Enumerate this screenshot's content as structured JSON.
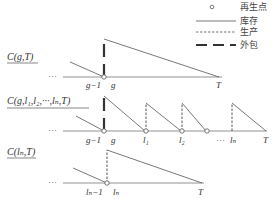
{
  "legend": {
    "items": [
      {
        "symbol": "circle",
        "label": "再生点"
      },
      {
        "symbol": "solid-line",
        "label": "库存"
      },
      {
        "symbol": "dashed-line",
        "label": "生产"
      },
      {
        "symbol": "thick-dashed-line",
        "label": "外包"
      }
    ]
  },
  "panels": [
    {
      "title": "C(g,T)",
      "ellipsis": "···",
      "ticks": [
        "g−1",
        "g",
        "T"
      ]
    },
    {
      "title": "C(g,l₁,l₂,···,lₙ,T)",
      "ellipsis": "···",
      "ticks": [
        "g−1",
        "g",
        "l₁",
        "l₂",
        "···",
        "lₙ",
        "T"
      ]
    },
    {
      "title": "C(lₙ,T)",
      "ellipsis": "···",
      "ticks": [
        "lₙ−1",
        "lₙ",
        "T"
      ]
    }
  ],
  "colors": {
    "line": "#555555",
    "text": "#333333",
    "background": "#ffffff"
  }
}
